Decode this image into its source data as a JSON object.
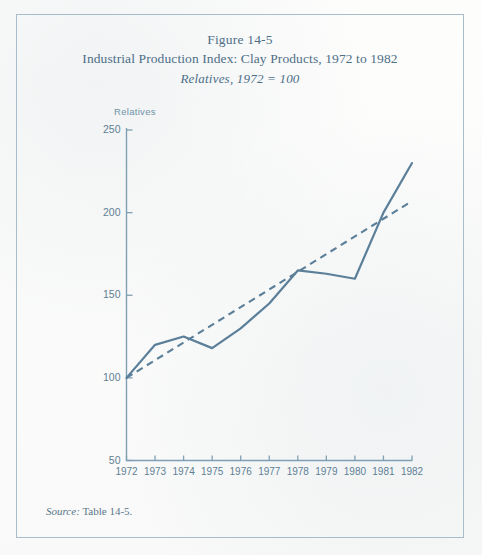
{
  "figure": {
    "title_line1": "Figure 14-5",
    "title_line2": "Industrial Production Index: Clay Products, 1972 to 1982",
    "title_line3": "Relatives, 1972 = 100",
    "y_axis_unit_label": "Relatives",
    "source_label": "Source:",
    "source_text": "Table 14-5."
  },
  "colors": {
    "ink": "#4d6f87",
    "line": "#5b7f99",
    "axis": "#7fa0b4",
    "frame": "#a8bdc9",
    "paper": "#fbfbfa"
  },
  "chart_data": {
    "type": "line",
    "title": "Industrial Production Index: Clay Products, 1972 to 1982",
    "subtitle": "Relatives, 1972 = 100",
    "xlabel": "",
    "ylabel": "Relatives",
    "xlim": [
      1972,
      1982
    ],
    "ylim": [
      50,
      250
    ],
    "ytick_values": [
      50,
      100,
      150,
      200,
      250
    ],
    "ytick_labels": [
      "50",
      "100",
      "150",
      "200",
      "250"
    ],
    "x": [
      1972,
      1973,
      1974,
      1975,
      1976,
      1977,
      1978,
      1979,
      1980,
      1981,
      1982
    ],
    "xtick_labels": [
      "1972",
      "1973",
      "1974",
      "1975",
      "1976",
      "1977",
      "1978",
      "1979",
      "1980",
      "1981",
      "1982"
    ],
    "grid": false,
    "legend": false,
    "series": [
      {
        "name": "Industrial Production Index (Clay Products)",
        "style": "solid",
        "values": [
          100,
          120,
          125,
          118,
          130,
          145,
          165,
          163,
          160,
          200,
          230
        ]
      },
      {
        "name": "Trend line",
        "style": "dashed",
        "values": [
          100,
          110.7,
          121.4,
          132.1,
          142.8,
          153.5,
          164.2,
          174.9,
          185.6,
          196.3,
          207
        ]
      }
    ]
  }
}
